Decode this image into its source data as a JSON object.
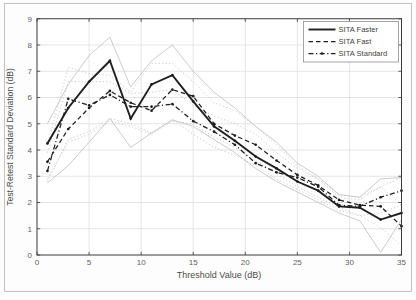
{
  "figure": {
    "frame_color": "#c2c2c2",
    "plot_background": "#ffffff",
    "axis_color": "#3a3a3a",
    "grid_color": "#dedede",
    "tick_label_color": "#616161",
    "axis_label_color": "#4c4c4c",
    "main_line_color": "#1f1f1f",
    "bound_line_color": "#c5c5c5"
  },
  "chart_data": {
    "type": "line",
    "title": "",
    "xlabel": "Threshold Value (dB)",
    "ylabel": "Test-Retest Standard Deviation (dB)",
    "xlim": [
      0,
      35
    ],
    "ylim": [
      0,
      9
    ],
    "xticks": [
      0,
      5,
      10,
      15,
      20,
      25,
      30,
      35
    ],
    "yticks": [
      0,
      1,
      2,
      3,
      4,
      5,
      6,
      7,
      8,
      9
    ],
    "grid": true,
    "legend_position": "top-right",
    "x": [
      1,
      3,
      5,
      7,
      9,
      11,
      13,
      15,
      17,
      19,
      21,
      23,
      25,
      27,
      29,
      31,
      33,
      35
    ],
    "series": [
      {
        "name": "SITA Standard",
        "style": "dashdot",
        "markers": true,
        "values": [
          3.2,
          5.95,
          5.7,
          6.1,
          5.65,
          5.65,
          5.75,
          5.1,
          4.7,
          4.2,
          3.5,
          3.15,
          2.95,
          2.6,
          1.9,
          1.85,
          2.2,
          2.45
        ]
      },
      {
        "name": "SITA Fast",
        "style": "dashed",
        "markers": true,
        "values": [
          3.55,
          4.8,
          5.6,
          6.25,
          5.8,
          5.5,
          6.3,
          6.05,
          5.0,
          4.55,
          4.2,
          3.6,
          3.05,
          2.65,
          2.1,
          1.9,
          1.85,
          1.1
        ]
      },
      {
        "name": "SITA Faster",
        "style": "solid",
        "markers": true,
        "values": [
          4.25,
          5.6,
          6.6,
          7.4,
          5.2,
          6.5,
          6.85,
          5.85,
          4.9,
          4.35,
          3.75,
          3.3,
          2.8,
          2.45,
          1.85,
          1.8,
          1.35,
          1.6
        ]
      }
    ],
    "confidence_bounds": [
      {
        "name": "upper-bound-faster",
        "style": "solid",
        "values": [
          5.0,
          6.5,
          7.6,
          8.3,
          6.4,
          7.4,
          8.0,
          7.0,
          6.2,
          5.6,
          4.9,
          4.3,
          3.5,
          3.0,
          2.3,
          2.2,
          2.9,
          2.95
        ]
      },
      {
        "name": "lower-bound-faster",
        "style": "solid",
        "values": [
          2.75,
          3.4,
          4.3,
          5.2,
          4.1,
          4.65,
          5.15,
          4.9,
          4.4,
          3.9,
          3.3,
          2.8,
          2.4,
          2.0,
          1.6,
          1.3,
          0.1,
          1.35
        ]
      },
      {
        "name": "upper-bound-fast",
        "style": "dotted",
        "values": [
          4.2,
          7.15,
          6.9,
          6.85,
          6.2,
          7.3,
          7.3,
          6.6,
          5.8,
          5.5,
          4.9,
          4.2,
          3.4,
          2.9,
          2.2,
          2.1,
          2.6,
          1.9
        ]
      },
      {
        "name": "lower-bound-fast",
        "style": "dotted",
        "values": [
          2.9,
          4.3,
          4.6,
          5.1,
          4.9,
          4.6,
          5.1,
          5.0,
          4.5,
          4.1,
          3.6,
          3.1,
          2.6,
          2.2,
          1.8,
          1.5,
          1.05,
          0.35
        ]
      },
      {
        "name": "upper-bound-standard",
        "style": "dotted",
        "values": [
          3.9,
          6.6,
          6.6,
          6.6,
          6.15,
          6.2,
          6.3,
          5.7,
          5.3,
          5.0,
          4.6,
          3.9,
          3.3,
          2.9,
          2.3,
          2.2,
          2.6,
          2.95
        ]
      },
      {
        "name": "lower-bound-standard",
        "style": "dotted",
        "values": [
          2.8,
          4.4,
          4.7,
          5.2,
          5.0,
          4.65,
          5.15,
          4.6,
          4.1,
          3.8,
          3.4,
          2.9,
          2.5,
          2.1,
          1.7,
          1.5,
          1.6,
          1.9
        ]
      }
    ]
  }
}
